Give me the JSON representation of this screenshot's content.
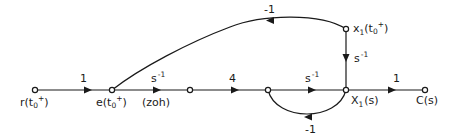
{
  "diagram": {
    "type": "signal-flow-graph",
    "nodes": [
      {
        "id": "r",
        "label": "r(t",
        "sub": "0",
        "sup": "+",
        "close": ")"
      },
      {
        "id": "e",
        "label": "e(t",
        "sub": "0",
        "sup": "+",
        "close": ")"
      },
      {
        "id": "n3",
        "label": ""
      },
      {
        "id": "n4",
        "label": ""
      },
      {
        "id": "X1",
        "label": "X",
        "sub": "1",
        "close": "(s)"
      },
      {
        "id": "C",
        "label": "C(s)"
      },
      {
        "id": "x1t0",
        "label": "x",
        "sub": "1",
        "mid": "(t",
        "sub2": "0",
        "sup": "+",
        "close": ")"
      }
    ],
    "edges": [
      {
        "from": "r",
        "to": "e",
        "gain": "1"
      },
      {
        "from": "e",
        "to": "n3",
        "gain": "s",
        "gain_sup": "-1",
        "note": "(zoh)"
      },
      {
        "from": "n3",
        "to": "n4",
        "gain": "4"
      },
      {
        "from": "n4",
        "to": "X1",
        "gain": "s",
        "gain_sup": "-1"
      },
      {
        "from": "X1",
        "to": "C",
        "gain": "1"
      },
      {
        "from": "X1",
        "to": "n4",
        "gain": "-1"
      },
      {
        "from": "x1t0",
        "to": "X1",
        "gain": "s",
        "gain_sup": "-1"
      },
      {
        "from": "x1t0",
        "to": "e",
        "gain": "-1"
      }
    ]
  }
}
